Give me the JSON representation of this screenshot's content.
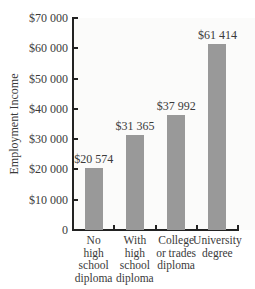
{
  "chart_data": {
    "type": "bar",
    "title": "",
    "xlabel": "",
    "ylabel": "Employment Income",
    "ylim": [
      0,
      70000
    ],
    "grid": false,
    "legend": null,
    "yticks": [
      "0",
      "$10 000",
      "$20 000",
      "$30 000",
      "$40 000",
      "$50 000",
      "$60 000",
      "$70 000"
    ],
    "ytick_values": [
      0,
      10000,
      20000,
      30000,
      40000,
      50000,
      60000,
      70000
    ],
    "categories": [
      "No high school diploma",
      "With high school diploma",
      "College or trades diploma",
      "University degree"
    ],
    "category_lines": [
      "No\nhigh\nschool\ndiploma",
      "With\nhigh\nschool\ndiploma",
      "College\nor trades\ndiploma",
      "University\ndegree"
    ],
    "values": [
      20574,
      31365,
      37992,
      61414
    ],
    "value_labels": [
      "$20 574",
      "$31 365",
      "$37 992",
      "$61 414"
    ],
    "bar_color": "#999999"
  }
}
